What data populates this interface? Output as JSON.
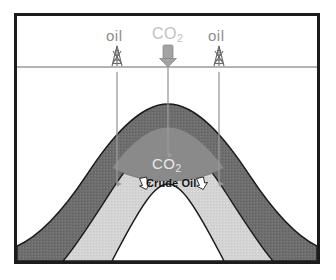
{
  "figure": {
    "type": "geological-cross-section",
    "title_text": "",
    "frame": {
      "border_color": "#1c1c1c",
      "background": "#ffffff"
    }
  },
  "surface": {
    "ground_line_label": "ground-surface-line",
    "line_color": "#9a9a9a"
  },
  "annotations": {
    "oil_left": {
      "label": "oil",
      "sub": "",
      "color": "#8d8d8d"
    },
    "oil_right": {
      "label": "oil",
      "sub": "",
      "color": "#8d8d8d"
    },
    "co2_top": {
      "label": "CO",
      "sub": "2",
      "color": "#c2c2c2"
    },
    "co2_reservoir": {
      "label": "CO",
      "sub": "2",
      "color": "#e8e8e8"
    },
    "crude_oil": {
      "label": "Crude Oil",
      "color": "#151515"
    }
  },
  "wells": [
    {
      "name": "oil-production-well-left",
      "flow": "up",
      "color": "#9a9a9a"
    },
    {
      "name": "co2-injection-well-center",
      "flow": "down",
      "color": "#9a9a9a"
    },
    {
      "name": "oil-production-well-right",
      "flow": "up",
      "color": "#9a9a9a"
    }
  ],
  "icons": {
    "derrick_left": "oil-derrick-icon",
    "derrick_right": "oil-derrick-icon",
    "co2_injector": "co2-injector-icon",
    "arrow_oil_flow_left": "white-flow-arrow-icon",
    "arrow_oil_flow_right": "white-flow-arrow-icon"
  },
  "strata": [
    {
      "name": "caprock-layer",
      "fill": "#6e6e6e",
      "stroke": "#1c1c1c"
    },
    {
      "name": "reservoir-layer",
      "fill": "#d4d4d4",
      "stroke": "#1c1c1c"
    },
    {
      "name": "core-layer",
      "fill": "#ffffff",
      "stroke": "#1c1c1c"
    },
    {
      "name": "co2-plume-cap",
      "fill": "#8a8a8a",
      "stroke": "#6e6e6e"
    }
  ]
}
